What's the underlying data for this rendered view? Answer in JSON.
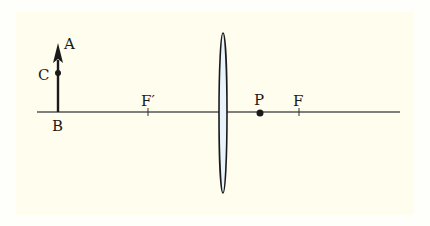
{
  "diagram": {
    "type": "optics-thin-lens",
    "colors": {
      "background": "#fffdee",
      "outer_background": "#fefefa",
      "stroke": "#1a1a1a",
      "axis": "#555555",
      "lens_fill": "#e8f3fb"
    },
    "labels": {
      "A": "A",
      "B": "B",
      "C": "C",
      "F_prime": "F′",
      "P": "P",
      "F": "F"
    },
    "elements": {
      "optical_axis": {
        "x1": 37,
        "x2": 400,
        "y": 112
      },
      "object_arrow": {
        "x": 58,
        "base_y": 112,
        "tip_y": 45,
        "point_C_y": 73
      },
      "lens": {
        "cx": 223,
        "cy": 113,
        "rx": 4,
        "ry": 80
      },
      "focal_point_F_prime": {
        "x": 148
      },
      "focal_point_F": {
        "x": 299
      },
      "point_P": {
        "x": 260
      }
    }
  }
}
